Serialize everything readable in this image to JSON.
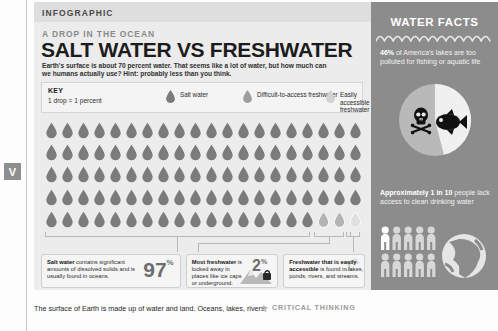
{
  "margin_marker": {
    "label": "V"
  },
  "panel": {
    "infographic_label": "INFOGRAPHIC",
    "kicker": "A DROP IN THE OCEAN",
    "headline": "SALT WATER VS FRESHWATER",
    "dek": "Earth's surface is about 70 percent water. That seems like a lot of water, but how much can we humans actually use? Hint: probably less than you think."
  },
  "key": {
    "title": "KEY",
    "subtitle": "1 drop = 1 percent",
    "entries": [
      {
        "label": "Salt water",
        "color": "#7b7b7b",
        "name": "salt-water"
      },
      {
        "label": "Difficult-to-access freshwater",
        "color": "#9e9e9e",
        "name": "difficult-freshwater"
      },
      {
        "label": "Easily accessible freshwater",
        "color": "#d2d2d2",
        "name": "easy-freshwater"
      }
    ]
  },
  "grid": {
    "columns": 20,
    "rows": 5,
    "total": 100,
    "salt_water_count": 97,
    "difficult_freshwater_count": 2,
    "easy_freshwater_count": 1,
    "colors": {
      "salt": "#7b7b7b",
      "difficult": "#b4b4b4",
      "easy": "#e0e0e0"
    }
  },
  "stats": [
    {
      "bold": "Salt water",
      "rest": " contains significant amounts of dissolved solids and is usually found in oceans.",
      "value": "97",
      "unit": "%",
      "name": "stat-salt-water"
    },
    {
      "bold": "Most freshwater",
      "rest": " is locked away in places like ice caps or underground.",
      "value": "2",
      "unit": "%",
      "name": "stat-difficult-freshwater"
    },
    {
      "bold": "Freshwater that is easily accessible",
      "rest": " is found in lakes, ponds, rivers, and streams.",
      "value": "1",
      "unit": "%",
      "name": "stat-easy-freshwater"
    }
  ],
  "facts": {
    "title": "WATER FACTS",
    "fact1_bold": "46%",
    "fact1_rest": " of America's lakes are too polluted for fishing or aquatic life",
    "fact2_bold": "Approximately 1 in 10",
    "fact2_rest": " people lack access to clean drinking water",
    "people_count": 10,
    "people_highlight": 1
  },
  "chart_data": {
    "type": "pie",
    "categories": [
      "Too polluted for fishing or aquatic life",
      "Suitable for aquatic life"
    ],
    "values": [
      46,
      54
    ],
    "labels": [
      "46%",
      "54%"
    ],
    "icons": [
      "skull-and-crossbones-icon",
      "fish-icon"
    ],
    "legend": "none",
    "unit": "percent"
  },
  "caption": {
    "text": "The surface of Earth is made up of water and land. Oceans, lakes, rivers,",
    "critical_thinking": "CRITICAL THINKING"
  }
}
